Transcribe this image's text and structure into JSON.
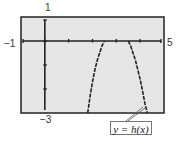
{
  "chart_data": {
    "type": "line",
    "title": "",
    "xlabel": "",
    "ylabel": "",
    "xlim": [
      -1,
      5
    ],
    "ylim": [
      -3,
      1
    ],
    "window_labels": {
      "ymax": "1",
      "xmin": "−1",
      "xmax": "5",
      "ymin": "−3"
    },
    "x_ticks": [
      0,
      1,
      2,
      3,
      4
    ],
    "y_ticks": [
      -2,
      -1,
      0
    ],
    "grid": false,
    "background": "#e6e6e6",
    "series": [
      {
        "name": "y = h(x)",
        "style": "dashed",
        "points": [
          [
            1.8,
            -3.0
          ],
          [
            1.9,
            -2.3
          ],
          [
            2.0,
            -1.7
          ],
          [
            2.1,
            -1.2
          ],
          [
            2.2,
            -0.8
          ],
          [
            2.3,
            -0.5
          ],
          [
            2.4,
            -0.2
          ],
          [
            2.5,
            0.0
          ],
          [
            3.5,
            0.0
          ],
          [
            3.6,
            -0.2
          ],
          [
            3.7,
            -0.5
          ],
          [
            3.8,
            -0.8
          ],
          [
            3.9,
            -1.2
          ],
          [
            4.0,
            -1.6
          ],
          [
            4.1,
            -2.1
          ],
          [
            4.2,
            -2.6
          ],
          [
            4.3,
            -3.0
          ]
        ]
      }
    ],
    "annotations": [
      {
        "text": "y = h(x)",
        "points_to": [
          4.3,
          -3.0
        ]
      }
    ]
  }
}
